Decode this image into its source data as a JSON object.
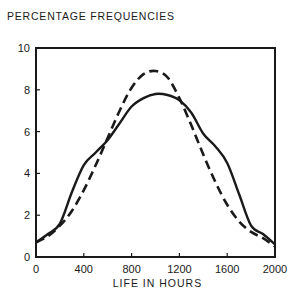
{
  "chart_data": {
    "type": "line",
    "title": "",
    "ylabel": "PERCENTAGE FREQUENCIES",
    "xlabel": "LIFE IN HOURS",
    "xlim": [
      0,
      2000
    ],
    "ylim": [
      0,
      10
    ],
    "xticks": [
      0,
      400,
      800,
      1200,
      1600,
      2000
    ],
    "yticks": [
      0,
      2,
      4,
      6,
      8,
      10
    ],
    "grid": false,
    "legend": null,
    "series": [
      {
        "name": "observed",
        "style": "solid",
        "x": [
          0,
          100,
          200,
          300,
          400,
          500,
          600,
          700,
          800,
          900,
          1000,
          1100,
          1200,
          1300,
          1400,
          1500,
          1600,
          1700,
          1800,
          1900,
          2000
        ],
        "y": [
          0.7,
          1.1,
          1.6,
          3.1,
          4.4,
          5.0,
          5.6,
          6.4,
          7.2,
          7.6,
          7.8,
          7.75,
          7.5,
          6.9,
          5.9,
          5.3,
          4.5,
          3.0,
          1.5,
          1.1,
          0.6
        ]
      },
      {
        "name": "fitted normal",
        "style": "dashed",
        "x": [
          0,
          100,
          200,
          300,
          400,
          500,
          600,
          700,
          800,
          900,
          1000,
          1100,
          1200,
          1300,
          1400,
          1500,
          1600,
          1700,
          1800,
          1900,
          2000
        ],
        "y": [
          0.7,
          1.0,
          1.5,
          2.2,
          3.2,
          4.4,
          5.7,
          7.0,
          8.1,
          8.75,
          8.9,
          8.6,
          7.6,
          6.3,
          4.9,
          3.6,
          2.5,
          1.7,
          1.2,
          0.9,
          0.5
        ]
      }
    ]
  }
}
